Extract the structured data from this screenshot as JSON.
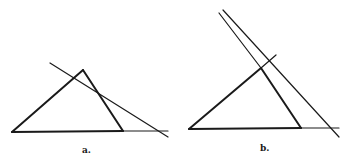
{
  "figures": [
    {
      "label": "a.",
      "triangle": {
        "left": [
          12,
          132
        ],
        "apex": [
          83,
          70
        ],
        "right": [
          123,
          131
        ]
      },
      "base_extension_end": [
        168,
        131
      ],
      "secant": {
        "from": [
          50,
          63
        ],
        "to": [
          168,
          137
        ]
      },
      "label_pos": [
        82,
        145
      ]
    },
    {
      "label": "b.",
      "triangle": {
        "left": [
          189,
          129
        ],
        "apex": [
          261,
          68
        ],
        "right": [
          301,
          128
        ]
      },
      "base_extension_end": [
        339,
        128
      ],
      "left_side_extension_end": [
        276,
        55
      ],
      "right_side_extension_end": [
        219,
        13
      ],
      "secant": {
        "from": [
          223,
          10
        ],
        "to": [
          339,
          137
        ]
      },
      "label_pos": [
        260,
        143
      ]
    }
  ],
  "colors": {
    "stroke": "#1a1a1a",
    "background": "#ffffff"
  }
}
